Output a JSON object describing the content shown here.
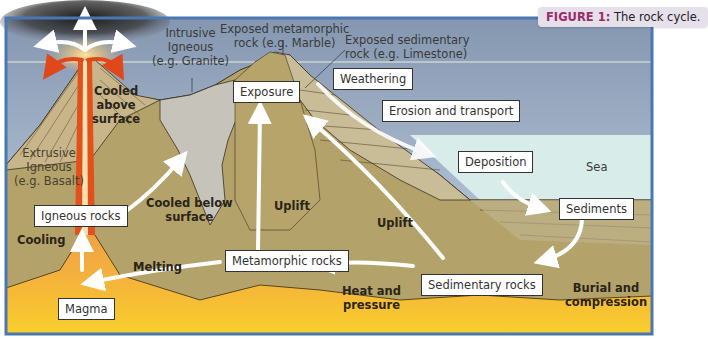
{
  "figure": {
    "number_label": "FIGURE 1:",
    "caption": "The rock cycle.",
    "accent_color": "#9a2c6a"
  },
  "annotations": {
    "intrusive_igneous": [
      "Intrusive",
      "Igneous",
      "(e.g. Granite)"
    ],
    "exposed_metamorphic": [
      "Exposed metamorphic",
      "rock (e.g. Marble)"
    ],
    "exposed_sedimentary": [
      "Exposed sedimentary",
      "rock (e.g. Limestone)"
    ],
    "extrusive_igneous": [
      "Extrusive",
      "Igneous",
      "(e.g. Basalt)"
    ],
    "sea": "Sea"
  },
  "process_labels": {
    "cooled_above": [
      "Cooled",
      "above",
      "surface"
    ],
    "cooled_below": [
      "Cooled below",
      "surface"
    ],
    "uplift_1": "Uplift",
    "uplift_2": "Uplift",
    "cooling": "Cooling",
    "melting": "Melting",
    "heat_pressure": [
      "Heat and",
      "pressure"
    ],
    "burial": [
      "Burial and",
      "compression"
    ]
  },
  "boxes": {
    "exposure": "Exposure",
    "weathering": "Weathering",
    "erosion": "Erosion and transport",
    "deposition": "Deposition",
    "sediments": "Sediments",
    "igneous_rocks": "Igneous rocks",
    "metamorphic_rocks": "Metamorphic rocks",
    "sedimentary_rocks": "Sedimentary rocks",
    "magma": "Magma"
  },
  "colors": {
    "sky_top": "#8a9ab4",
    "sky_bottom": "#c9dbe9",
    "sea": "#d8ecec",
    "ground": "#b5a56e",
    "magma": "#f7c530",
    "granite": "#c9c6bd",
    "lava": "#e2501c",
    "frame": "#4a77b4"
  }
}
